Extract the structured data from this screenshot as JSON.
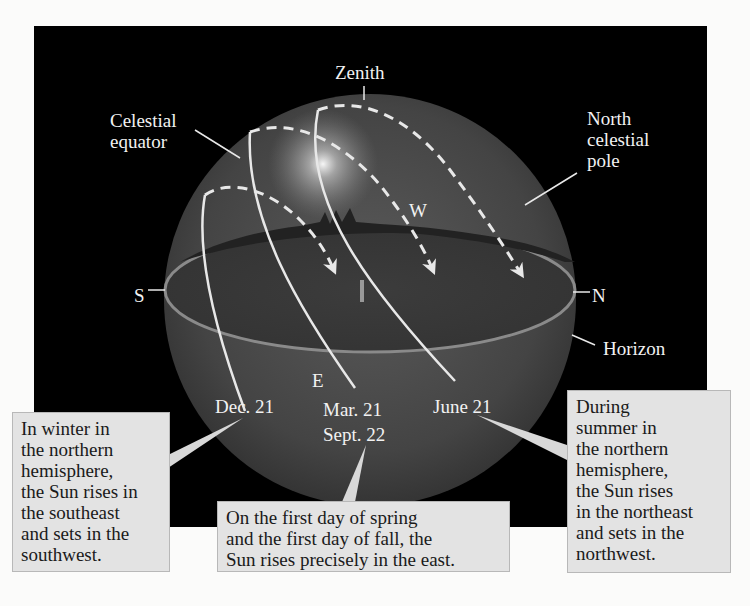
{
  "labels": {
    "zenith": "Zenith",
    "celestial_equator": [
      "Celestial",
      "equator"
    ],
    "north_celestial_pole": [
      "North",
      "celestial",
      "pole"
    ],
    "west": "W",
    "east": "E",
    "south": "S",
    "north": "N",
    "horizon": "Horizon",
    "dec21": "Dec. 21",
    "mar21": "Mar. 21",
    "sept22": "Sept. 22",
    "june21": "June 21"
  },
  "callouts": {
    "winter": [
      "In winter in",
      "the northern",
      "hemisphere,",
      "the Sun rises in",
      "the southeast",
      "and sets in the",
      "southwest."
    ],
    "equinox": [
      "On the first day of spring",
      "and the first day of fall, the",
      "Sun rises precisely in the east."
    ],
    "summer": [
      "During",
      "summer in",
      "the northern",
      "hemisphere,",
      "the Sun rises",
      "in the northeast",
      "and sets in the",
      "northwest."
    ]
  },
  "colors": {
    "background": "#000000",
    "sphere": "#4a4a4a",
    "horizon_ring": "#8a8a8a",
    "path": "#e8e8e8",
    "callout_fill": "#e3e3e3"
  }
}
